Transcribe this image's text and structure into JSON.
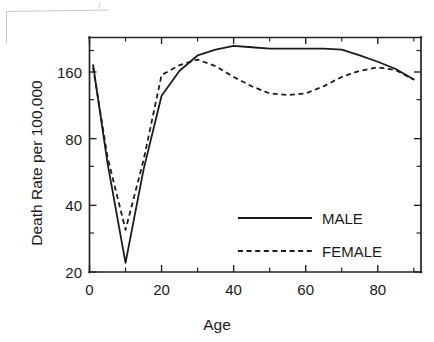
{
  "chart_data": {
    "type": "line",
    "title": "",
    "xlabel": "Age",
    "ylabel": "Death Rate per 100,000",
    "xlim": [
      0,
      92
    ],
    "ylim": [
      20,
      220
    ],
    "yscale": "log",
    "grid": false,
    "legend_position": "center-right",
    "x_ticks": [
      0,
      20,
      40,
      60,
      80
    ],
    "x_tick_labels": [
      "0",
      "20",
      "40",
      "60",
      "80"
    ],
    "x_minor_ticks": [
      10,
      30,
      50,
      70,
      90
    ],
    "y_ticks": [
      20,
      40,
      80,
      160
    ],
    "y_tick_labels": [
      "20",
      "40",
      "80",
      "160"
    ],
    "y_minor_ticks": [
      30,
      60,
      120,
      200
    ],
    "x": [
      1,
      5,
      10,
      15,
      20,
      25,
      30,
      35,
      40,
      45,
      50,
      55,
      60,
      65,
      70,
      75,
      80,
      85,
      90
    ],
    "series": [
      {
        "name": "MALE",
        "style": "solid",
        "values": [
          172,
          62,
          22,
          58,
          125,
          162,
          190,
          202,
          210,
          207,
          204,
          204,
          204,
          204,
          202,
          190,
          178,
          165,
          148
        ]
      },
      {
        "name": "FEMALE",
        "style": "dashed",
        "values": [
          168,
          66,
          31,
          64,
          155,
          172,
          182,
          170,
          152,
          138,
          128,
          126,
          128,
          138,
          152,
          162,
          168,
          163,
          148
        ]
      }
    ],
    "annotations": []
  },
  "legend": {
    "entries": [
      {
        "label": "MALE",
        "style": "solid"
      },
      {
        "label": "FEMALE",
        "style": "dashed"
      }
    ]
  },
  "axes": {
    "x_title": "Age",
    "y_title": "Death Rate per 100,000"
  }
}
